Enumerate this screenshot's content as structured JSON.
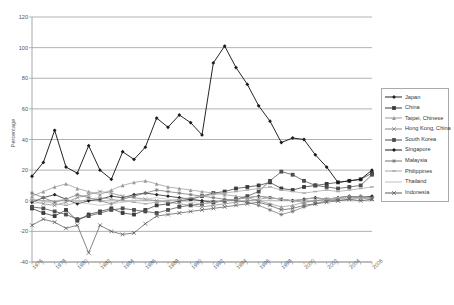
{
  "chart_data": {
    "type": "line",
    "title": "",
    "xlabel": "",
    "ylabel": "Percentage",
    "ylim": [
      -40,
      120
    ],
    "ytick_step": 20,
    "yticks": [
      120,
      100,
      80,
      60,
      40,
      20,
      0,
      -20,
      -40
    ],
    "grid": true,
    "legend_position": "right",
    "x": [
      1976,
      1977,
      1978,
      1979,
      1980,
      1981,
      1982,
      1983,
      1984,
      1985,
      1986,
      1987,
      1988,
      1989,
      1990,
      1991,
      1992,
      1993,
      1994,
      1995,
      1996,
      1997,
      1998,
      1999,
      2000,
      2001,
      2002,
      2003,
      2004,
      2005,
      2006
    ],
    "xtick_labels": [
      "1976",
      "1978",
      "1980",
      "1982",
      "1984",
      "1986",
      "1988",
      "1990",
      "1992",
      "1994",
      "1996",
      "1998",
      "2000",
      "2002",
      "2004",
      "2006"
    ],
    "xtick_values": [
      1976,
      1978,
      1980,
      1982,
      1984,
      1986,
      1988,
      1990,
      1992,
      1994,
      1996,
      1998,
      2000,
      2002,
      2004,
      2006
    ],
    "series": [
      {
        "name": "Japan",
        "color": "#222222",
        "marker": "diamond",
        "values": [
          -1,
          2,
          4,
          1,
          -2,
          0,
          1,
          3,
          2,
          4,
          5,
          4,
          3,
          2,
          1,
          0,
          -1,
          0,
          1,
          2,
          3,
          2,
          1,
          0,
          1,
          2,
          1,
          2,
          3,
          2,
          3
        ]
      },
      {
        "name": "China",
        "color": "#3a3a3a",
        "marker": "square",
        "values": [
          -5,
          -8,
          -10,
          -6,
          -13,
          -9,
          -7,
          -5,
          -8,
          -9,
          -6,
          -3,
          -2,
          0,
          1,
          3,
          5,
          6,
          8,
          9,
          10,
          12,
          8,
          7,
          9,
          10,
          11,
          12,
          13,
          14,
          18
        ]
      },
      {
        "name": "Taipei, Chinese",
        "color": "#9a9a9a",
        "marker": "triangle",
        "values": [
          3,
          6,
          9,
          11,
          8,
          6,
          4,
          7,
          10,
          12,
          13,
          11,
          9,
          8,
          7,
          6,
          5,
          4,
          3,
          2,
          0,
          -2,
          -4,
          -3,
          -1,
          0,
          1,
          2,
          3,
          2,
          1
        ]
      },
      {
        "name": "Hong Kong, China",
        "color": "#8a8a8a",
        "marker": "cross",
        "values": [
          0,
          -2,
          -3,
          -1,
          2,
          4,
          6,
          5,
          3,
          2,
          1,
          0,
          -1,
          -2,
          -3,
          -4,
          -3,
          -2,
          -1,
          0,
          1,
          2,
          1,
          0,
          -1,
          0,
          1,
          0,
          1,
          2,
          1
        ]
      },
      {
        "name": "South Korea",
        "color": "#4d4d4d",
        "marker": "square",
        "values": [
          -4,
          -5,
          -7,
          -9,
          -12,
          -10,
          -8,
          -6,
          -5,
          -6,
          -7,
          -8,
          -6,
          -4,
          -3,
          -2,
          -1,
          0,
          1,
          3,
          6,
          13,
          19,
          17,
          13,
          10,
          9,
          8,
          9,
          10,
          17
        ]
      },
      {
        "name": "Singapore",
        "color": "#1a1a1a",
        "marker": "diamond",
        "values": [
          16,
          25,
          46,
          22,
          18,
          36,
          20,
          14,
          32,
          27,
          35,
          54,
          48,
          56,
          51,
          43,
          90,
          101,
          87,
          76,
          62,
          52,
          38,
          41,
          40,
          30,
          22,
          12,
          13,
          14,
          20
        ]
      },
      {
        "name": "Malaysia",
        "color": "#777777",
        "marker": "star",
        "values": [
          5,
          2,
          -1,
          1,
          4,
          2,
          0,
          -2,
          1,
          3,
          5,
          7,
          6,
          5,
          4,
          3,
          2,
          1,
          0,
          -1,
          -3,
          -6,
          -9,
          -7,
          -4,
          -2,
          0,
          1,
          2,
          3,
          2
        ]
      },
      {
        "name": "Philippines",
        "color": "#a8a8a8",
        "marker": "bar",
        "values": [
          1,
          0,
          -2,
          -3,
          -1,
          1,
          2,
          1,
          0,
          -1,
          -2,
          -1,
          0,
          1,
          2,
          3,
          4,
          5,
          6,
          7,
          8,
          9,
          7,
          6,
          5,
          6,
          7,
          6,
          7,
          8,
          9
        ]
      },
      {
        "name": "Thailand",
        "color": "#c0c0c0",
        "marker": "none",
        "values": [
          -2,
          -1,
          0,
          1,
          -1,
          -2,
          -3,
          -2,
          -1,
          0,
          1,
          2,
          1,
          0,
          -1,
          -2,
          -1,
          0,
          1,
          2,
          3,
          2,
          1,
          0,
          1,
          2,
          1,
          2,
          1,
          2,
          1
        ]
      },
      {
        "name": "Indonesia",
        "color": "#5c5c5c",
        "marker": "cross",
        "values": [
          -16,
          -12,
          -14,
          -18,
          -16,
          -34,
          -16,
          -20,
          -22,
          -21,
          -15,
          -10,
          -9,
          -8,
          -7,
          -6,
          -5,
          -4,
          -3,
          -2,
          -1,
          -3,
          -6,
          -5,
          -3,
          -2,
          -1,
          0,
          1,
          0,
          1
        ]
      }
    ]
  },
  "axis": {
    "y_title": "Percentage"
  }
}
